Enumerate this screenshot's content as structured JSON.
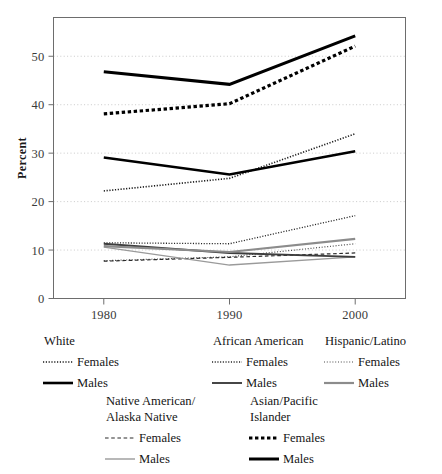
{
  "chart_data": {
    "type": "line",
    "title": "",
    "xlabel": "",
    "ylabel": "Percent",
    "x": [
      1980,
      1990,
      2000
    ],
    "xtick_labels": [
      "1980",
      "1990",
      "2000"
    ],
    "ytick_labels": [
      "0",
      "10",
      "20",
      "30",
      "40",
      "50"
    ],
    "yticks": [
      0,
      10,
      20,
      30,
      40,
      50
    ],
    "ylim": [
      0,
      58
    ],
    "xlim": [
      1976,
      2004
    ],
    "grid": "horizontal-dotted",
    "legend_position": "below-plot",
    "series": [
      {
        "name": "White Females",
        "group": "White",
        "sex": "Females",
        "values": [
          22.2,
          24.8,
          34.0
        ],
        "color": "#1a1a1a",
        "style": "fine-dotted",
        "width": 1.6,
        "dash": "1.2 1.6"
      },
      {
        "name": "White Males",
        "group": "White",
        "sex": "Males",
        "values": [
          29.1,
          25.6,
          30.4
        ],
        "color": "#000000",
        "style": "solid-heavy",
        "width": 2.6,
        "dash": "none"
      },
      {
        "name": "African American Females",
        "group": "African American",
        "sex": "Females",
        "values": [
          11.5,
          11.3,
          17.1
        ],
        "color": "#262626",
        "style": "fine-dotted",
        "width": 1.3,
        "dash": "1.1 1.6"
      },
      {
        "name": "African American Males",
        "group": "African American",
        "sex": "Males",
        "values": [
          11.3,
          9.4,
          8.6
        ],
        "color": "#3d3d3d",
        "style": "solid-medium",
        "width": 1.9,
        "dash": "none"
      },
      {
        "name": "Hispanic/Latino Females",
        "group": "Hispanic/Latino",
        "sex": "Females",
        "values": [
          7.8,
          8.6,
          11.3
        ],
        "color": "#4a4a4a",
        "style": "fine-dotted",
        "width": 1.2,
        "dash": "1 1.8"
      },
      {
        "name": "Hispanic/Latino Males",
        "group": "Hispanic/Latino",
        "sex": "Males",
        "values": [
          10.8,
          9.6,
          12.3
        ],
        "color": "#8c8c8c",
        "style": "solid-gray",
        "width": 2.2,
        "dash": "none"
      },
      {
        "name": "Native American/Alaska Native Females",
        "group": "Native American/Alaska Native",
        "sex": "Females",
        "values": [
          7.7,
          8.5,
          9.4
        ],
        "color": "#2b2b2b",
        "style": "dashed",
        "width": 1.2,
        "dash": "3.6 2.6"
      },
      {
        "name": "Native American/Alaska Native Males",
        "group": "Native American/Alaska Native",
        "sex": "Males",
        "values": [
          10.6,
          6.9,
          8.6
        ],
        "color": "#9a9a9a",
        "style": "solid-light",
        "width": 1.4,
        "dash": "none"
      },
      {
        "name": "Asian/Pacific Islander Females",
        "group": "Asian/Pacific Islander",
        "sex": "Females",
        "values": [
          38.1,
          40.2,
          52.1
        ],
        "color": "#000000",
        "style": "bold-square-dotted",
        "width": 3.2,
        "dash": "3.4 2.6"
      },
      {
        "name": "Asian/Pacific Islander Males",
        "group": "Asian/Pacific Islander",
        "sex": "Males",
        "values": [
          46.8,
          44.2,
          54.2
        ],
        "color": "#000000",
        "style": "solid-extra-heavy",
        "width": 3.0,
        "dash": "none"
      }
    ]
  },
  "legend": {
    "row1": [
      {
        "title": "White",
        "entries": [
          {
            "label": "Females",
            "style": "fine-dotted",
            "color": "#1a1a1a",
            "width": 1.6,
            "dash": "1.2 1.6"
          },
          {
            "label": "Males",
            "style": "solid-heavy",
            "color": "#000000",
            "width": 2.6,
            "dash": "none"
          }
        ]
      },
      {
        "title": "African American",
        "entries": [
          {
            "label": "Females",
            "style": "fine-dotted",
            "color": "#262626",
            "width": 1.3,
            "dash": "1.1 1.6"
          },
          {
            "label": "Males",
            "style": "solid-medium",
            "color": "#3d3d3d",
            "width": 1.9,
            "dash": "none"
          }
        ]
      },
      {
        "title": "Hispanic/Latino",
        "entries": [
          {
            "label": "Females",
            "style": "fine-dotted",
            "color": "#4a4a4a",
            "width": 1.2,
            "dash": "1 1.8"
          },
          {
            "label": "Males",
            "style": "solid-gray",
            "color": "#8c8c8c",
            "width": 2.2,
            "dash": "none"
          }
        ]
      }
    ],
    "row2": [
      {
        "title": "Native American/",
        "title2": "Alaska Native",
        "entries": [
          {
            "label": "Females",
            "style": "dashed",
            "color": "#2b2b2b",
            "width": 1.2,
            "dash": "3.6 2.6"
          },
          {
            "label": "Males",
            "style": "solid-light",
            "color": "#9a9a9a",
            "width": 1.4,
            "dash": "none"
          }
        ]
      },
      {
        "title": "Asian/Pacific",
        "title2": "Islander",
        "entries": [
          {
            "label": "Females",
            "style": "bold-square-dotted",
            "color": "#000000",
            "width": 3.2,
            "dash": "3.4 2.6"
          },
          {
            "label": "Males",
            "style": "solid-extra-heavy",
            "color": "#000000",
            "width": 3.0,
            "dash": "none"
          }
        ]
      }
    ]
  },
  "colors": {
    "frame": "#6d6d6d",
    "grid": "#bdbdbd",
    "text": "#151515",
    "background": "#ffffff"
  }
}
